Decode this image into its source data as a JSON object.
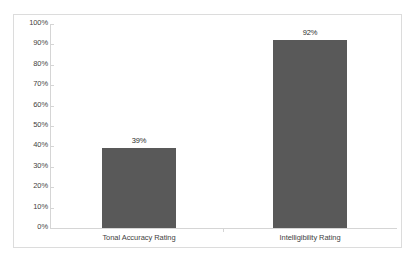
{
  "chart_data": {
    "type": "bar",
    "title": "",
    "xlabel": "",
    "ylabel": "",
    "categories": [
      "Tonal Accuracy Rating",
      "Intelligibility Rating"
    ],
    "values": [
      39,
      92
    ],
    "value_labels": [
      "39%",
      "92%"
    ],
    "ylim": [
      0,
      100
    ],
    "ytick_values": [
      0,
      10,
      20,
      30,
      40,
      50,
      60,
      70,
      80,
      90,
      100
    ],
    "ytick_labels": [
      "0%",
      "10%",
      "20%",
      "30%",
      "40%",
      "50%",
      "60%",
      "70%",
      "80%",
      "90%",
      "100%"
    ],
    "grid": false,
    "legend": false,
    "legend_position": "none",
    "bar_color": "#595959",
    "axis_color": "#d5d5d5",
    "border_color": "#dcdcdc",
    "plot_background": "#ffffff",
    "text_color": "#3f3f3f"
  }
}
